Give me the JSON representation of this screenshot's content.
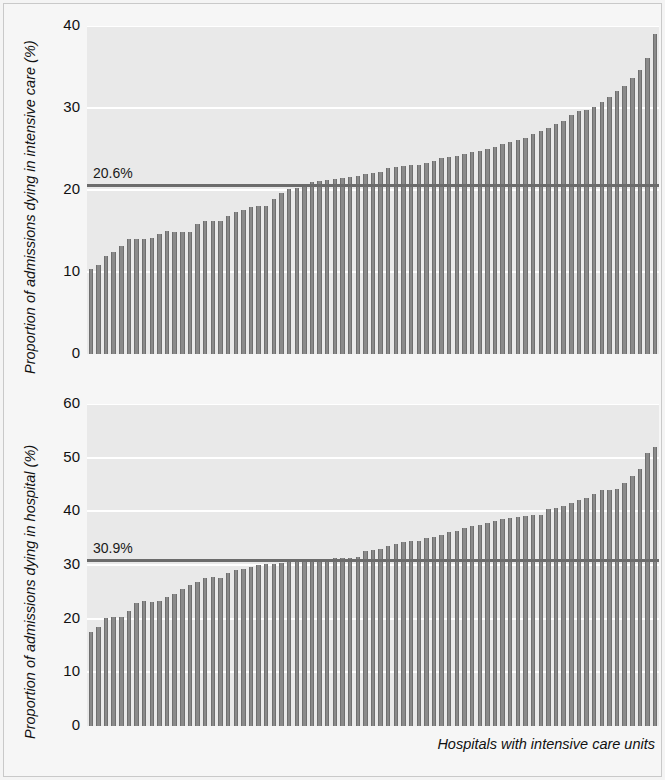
{
  "figure": {
    "background": "#f6f6f6",
    "plot_background": "#e9e9e9",
    "bar_color": "#8a8a8a",
    "bar_edge_color": "#6f6f6f",
    "refline_color": "#6b6b6b",
    "gridline_color": "#ffffff",
    "xlabel": "Hospitals with intensive care units"
  },
  "chart_data": [
    {
      "type": "bar",
      "id": "icu-mortality",
      "title": "",
      "xlabel": "",
      "ylabel": "Proportion of admissions dying in intensive care (%)",
      "ylim": [
        0,
        40
      ],
      "yticks": [
        0,
        10,
        20,
        30,
        40
      ],
      "ytick_labels": [
        "0",
        "10",
        "20",
        "30",
        "40"
      ],
      "grid": true,
      "legend": "none",
      "reference_line": {
        "value": 20.6,
        "label": "20.6%",
        "description": "overall proportion of admissions dying in intensive care"
      },
      "categories_description": "Hospitals with intensive care units, sorted ascending",
      "n_bars": 75,
      "values": [
        10.4,
        10.8,
        11.9,
        12.5,
        13.2,
        14.0,
        14.0,
        14.0,
        14.2,
        14.6,
        15.0,
        14.9,
        14.9,
        14.9,
        15.9,
        16.2,
        16.2,
        16.2,
        16.8,
        17.3,
        17.6,
        17.9,
        18.0,
        18.1,
        18.9,
        19.6,
        20.1,
        20.2,
        20.6,
        21.0,
        21.1,
        21.2,
        21.3,
        21.5,
        21.6,
        21.7,
        22.0,
        22.1,
        22.2,
        22.7,
        22.8,
        22.9,
        23.0,
        23.1,
        23.3,
        23.5,
        23.9,
        24.0,
        24.2,
        24.4,
        24.6,
        24.8,
        25.0,
        25.3,
        25.6,
        25.8,
        26.1,
        26.4,
        26.8,
        27.2,
        27.6,
        28.1,
        28.4,
        29.1,
        29.6,
        29.8,
        30.1,
        30.7,
        31.3,
        32.1,
        32.7,
        33.6,
        34.6,
        36.1,
        39.0
      ]
    },
    {
      "type": "bar",
      "id": "hospital-mortality",
      "title": "",
      "xlabel": "Hospitals with intensive care units",
      "ylabel": "Proportion of admissions dying in hospital (%)",
      "ylim": [
        0,
        60
      ],
      "yticks": [
        0,
        10,
        20,
        30,
        40,
        50,
        60
      ],
      "ytick_labels": [
        "0",
        "10",
        "20",
        "30",
        "40",
        "50",
        "60"
      ],
      "grid": true,
      "legend": "none",
      "reference_line": {
        "value": 30.9,
        "label": "30.9%",
        "description": "overall proportion of admissions dying in hospital"
      },
      "categories_description": "Hospitals with intensive care units, sorted ascending",
      "n_bars": 75,
      "values": [
        17.6,
        18.5,
        20.1,
        20.4,
        20.3,
        21.5,
        22.9,
        23.3,
        23.2,
        23.3,
        24.1,
        24.6,
        25.6,
        26.2,
        26.8,
        27.6,
        27.7,
        27.6,
        28.6,
        29.1,
        29.2,
        29.7,
        30.0,
        30.2,
        30.2,
        30.3,
        30.5,
        30.9,
        31.0,
        31.0,
        31.1,
        31.2,
        31.3,
        31.4,
        31.4,
        31.5,
        32.6,
        32.8,
        33.0,
        33.5,
        34.0,
        34.2,
        34.4,
        34.5,
        35.0,
        35.2,
        35.6,
        36.1,
        36.4,
        36.9,
        37.2,
        37.4,
        37.8,
        38.2,
        38.5,
        38.8,
        39.0,
        39.1,
        39.3,
        39.4,
        40.5,
        40.6,
        41.0,
        41.5,
        42.2,
        42.5,
        43.2,
        43.9,
        44.0,
        44.1,
        45.3,
        46.5,
        47.8,
        50.8,
        52.0
      ]
    }
  ]
}
